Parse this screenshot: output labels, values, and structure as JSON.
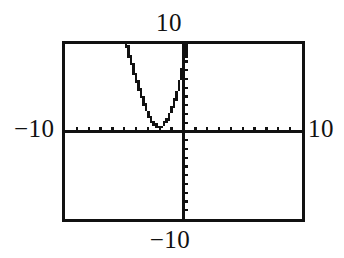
{
  "screen": {
    "width": 344,
    "height": 258,
    "background_color": "#ffffff",
    "ink_color": "#111111",
    "description": "graphing-calculator-screen"
  },
  "frame": {
    "border_color": "#111111",
    "border_width_px": 3,
    "left": 62,
    "top": 41,
    "width": 243,
    "height": 181
  },
  "labels": {
    "top": "10",
    "bottom": "−10",
    "left": "−10",
    "right": "10"
  },
  "chart_data": {
    "type": "line",
    "title": "",
    "xlabel": "",
    "ylabel": "",
    "xlim": [
      -10,
      10
    ],
    "ylim": [
      -10,
      10
    ],
    "grid": false,
    "legend": false,
    "axes": {
      "x_axis_y_value": 0,
      "y_axis_x_value": 0,
      "xtick_step": 1,
      "ytick_step": 1,
      "xticks": [
        -9,
        -8,
        -7,
        -6,
        -5,
        -4,
        -3,
        -2,
        -1,
        1,
        2,
        3,
        4,
        5,
        6,
        7,
        8,
        9
      ],
      "yticks": [
        -9,
        -8,
        -7,
        -6,
        -5,
        -4,
        -3,
        -2,
        -1,
        1,
        2,
        3,
        4,
        5,
        6,
        7,
        8,
        9
      ],
      "tick_style": "pixel-ticks"
    },
    "series": [
      {
        "name": "parabola",
        "shape": "upward-parabola",
        "style": "pixelated-staircase",
        "color": "#111111",
        "vertex": [
          -2.3,
          0.5
        ],
        "x": [
          -4.8,
          -4.6,
          -4.4,
          -4.2,
          -4.0,
          -3.8,
          -3.6,
          -3.4,
          -3.2,
          -3.0,
          -2.8,
          -2.6,
          -2.4,
          -2.2,
          -2.0,
          -1.8,
          -1.6,
          -1.4,
          -1.2,
          -1.0,
          -0.8,
          -0.6,
          -0.4,
          -0.2,
          0.0,
          0.2,
          0.35
        ],
        "y": [
          9.9,
          8.9,
          7.9,
          7.0,
          6.1,
          5.2,
          4.4,
          3.6,
          2.9,
          2.2,
          1.6,
          1.1,
          0.7,
          0.5,
          0.5,
          0.6,
          0.9,
          1.3,
          1.8,
          2.5,
          3.2,
          4.1,
          5.1,
          6.2,
          7.4,
          8.7,
          9.9
        ],
        "equation_hint": "y ≈ 1.8(x + 2.3)² + 0.5"
      }
    ]
  }
}
